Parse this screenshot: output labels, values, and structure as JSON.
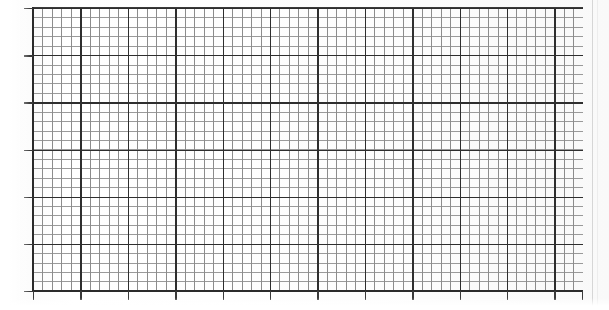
{
  "document": {
    "kind": "scanned-graph-paper",
    "title": "Blank grid plot area"
  },
  "chart_data": {
    "type": "table",
    "title": "",
    "subtitle": "",
    "xlabel": "",
    "ylabel": "",
    "grid": "on",
    "legend": "none",
    "series": [],
    "categories": [],
    "values": [],
    "annotations": [],
    "x_major_ticks": 12,
    "y_major_ticks": 6,
    "minor_per_major": 5,
    "x_tick_labels": [],
    "y_tick_labels": []
  },
  "grid": {
    "minor_color": "#8c8c8c",
    "major_color": "#2e2e2e",
    "axis_color": "#2b2b2b",
    "background_color": "#fdfdfd",
    "minor_cell_px_x": 9.48,
    "minor_cell_px_y": 9.43,
    "major_cell_px_x": 47.4,
    "major_cell_px_y": 47.17,
    "plot_left_px": 33,
    "plot_top_px": 8,
    "plot_width_px": 550,
    "plot_height_px": 283
  },
  "ticks": {
    "x_positions_px": [
      0,
      47.4,
      94.8,
      142.2,
      189.6,
      237,
      284.4,
      331.8,
      379.2,
      426.6,
      474,
      521.4,
      549
    ],
    "y_positions_px": [
      0,
      47.17,
      94.34,
      141.51,
      188.68,
      235.85,
      283
    ]
  },
  "artifacts": {
    "right_edge_line_color": "#d6d6d6",
    "right_edge_line_x_px": 592
  }
}
